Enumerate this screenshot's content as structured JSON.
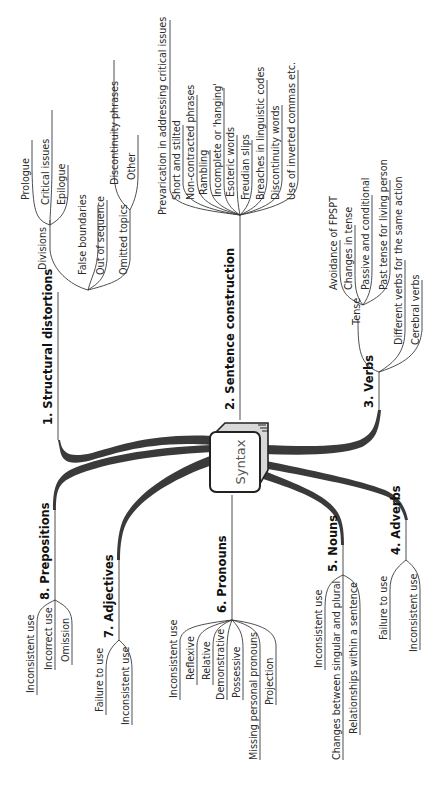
{
  "title": "Syntax",
  "orientation": "rotated-90-ccw",
  "colors": {
    "text": "#2b2b2b",
    "branch_fill": "#3a3a3a",
    "node_fill": "#ffffff",
    "node_shadow": "#c8c8c8"
  },
  "branches": [
    {
      "label": "1.  Structural distortions",
      "children": [
        {
          "label": "Divisions",
          "children": [
            "Prologue",
            "Critical issues",
            "Epilogue"
          ]
        },
        {
          "label": "False boundaries"
        },
        {
          "label": "Out of sequence"
        },
        {
          "label": "Omitted topics",
          "children": [
            "Discontinuity phrases",
            "Other"
          ]
        }
      ]
    },
    {
      "label": "2.  Sentence construction",
      "children": [
        "Prevarication in addressing critical issues",
        "Short and stilted",
        "Non-contracted phrases",
        "Rambling",
        "Incomplete or 'hanging'",
        "Esoteric words",
        "Freudian slips",
        "Breaches in linguistic codes",
        "Discontinuity words",
        "Use of inverted commas etc."
      ]
    },
    {
      "label": "3.  Verbs",
      "children": [
        {
          "label": "Tense",
          "children": [
            "Avoidance of FPSPT",
            "Changes in tense",
            "Passive and conditional",
            "Past tense for living person"
          ]
        },
        {
          "label": "Different verbs for the same action"
        },
        {
          "label": "Cerebral verbs"
        }
      ]
    },
    {
      "label": "4.  Adverbs",
      "children": [
        "Failure to use",
        "Inconsistent use"
      ]
    },
    {
      "label": "5.  Nouns",
      "children": [
        "Inconsistent use",
        "Changes between singular and plural",
        "Relationships within a sentence"
      ]
    },
    {
      "label": "6.  Pronouns",
      "children": [
        "Inconsistent use",
        "Reflexive",
        "Relative",
        "Demonstrative",
        "Possessive",
        "Missing personal pronouns",
        "Projection"
      ]
    },
    {
      "label": "7.  Adjectives",
      "children": [
        "Failure to use",
        "Inconsistent use"
      ]
    },
    {
      "label": "8.  Prepositions",
      "children": [
        "Inconsistent use",
        "Incorrect use",
        "Omission"
      ]
    }
  ]
}
